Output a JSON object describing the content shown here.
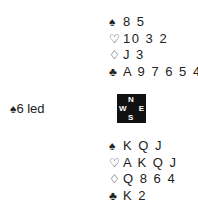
{
  "north": {
    "spades": {
      "symbol": "♠",
      "cards": "8 5"
    },
    "hearts": {
      "symbol": "♡",
      "cards": "10 3 2"
    },
    "diamonds": {
      "symbol": "♢",
      "cards": "J 3"
    },
    "clubs": {
      "symbol": "♣",
      "cards": "A 9 7 6 5 4"
    }
  },
  "south": {
    "spades": {
      "symbol": "♠",
      "cards": "K Q J"
    },
    "hearts": {
      "symbol": "♡",
      "cards": "A K Q J"
    },
    "diamonds": {
      "symbol": "♢",
      "cards": "Q 8 6 4"
    },
    "clubs": {
      "symbol": "♣",
      "cards": "K 2"
    }
  },
  "lead": {
    "symbol": "♠",
    "text": "6 led"
  },
  "compass": {
    "n": "N",
    "s": "S",
    "w": "W",
    "e": "E"
  }
}
